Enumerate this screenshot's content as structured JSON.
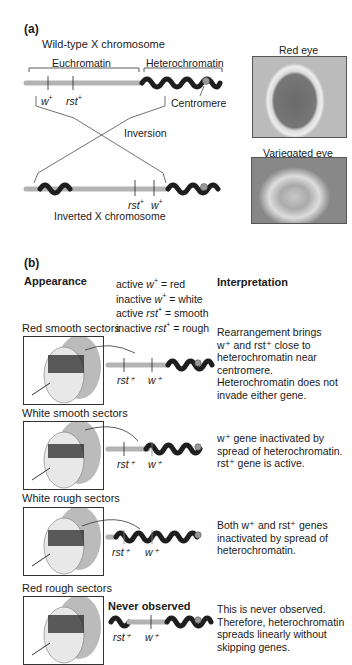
{
  "panel_a": {
    "label": "(a)",
    "wildtype_title": "Wild-type X chromosome",
    "euchromatin_label": "Euchromatin",
    "heterochromatin_label": "Heterochromatin",
    "gene_w": "w",
    "gene_rst": "rst",
    "plus": "+",
    "centromere_label": "Centromere",
    "inversion_label": "Inversion",
    "inverted_title": "Inverted X chromosome",
    "photos": {
      "red_eye_label": "Red eye",
      "variegated_eye_label": "Variegated eye"
    }
  },
  "panel_b": {
    "label": "(b)",
    "appearance_header": "Appearance",
    "interpretation_header": "Interpretation",
    "legend": [
      {
        "state": "active",
        "gene": "w",
        "result": "= red"
      },
      {
        "state": "inactive",
        "gene": "w",
        "result": "= white"
      },
      {
        "state": "active",
        "gene": "rst",
        "result": "= smooth"
      },
      {
        "state": "inactive",
        "gene": "rst",
        "result": "= rough"
      }
    ],
    "rows": [
      {
        "title": "Red smooth sectors",
        "interpretation": [
          "Rearrangement brings",
          "w⁺ and rst⁺ close to",
          "heterochromatin near",
          "centromere.",
          "Heterochromatin does not",
          "invade either gene."
        ]
      },
      {
        "title": "White smooth sectors",
        "interpretation": [
          "w⁺ gene inactivated by",
          "spread of heterochromatin.",
          "rst⁺ gene is active."
        ]
      },
      {
        "title": "White rough sectors",
        "interpretation": [
          "Both w⁺ and rst⁺ genes",
          "inactivated by spread of",
          "heterochromatin."
        ]
      },
      {
        "title": "Red rough sectors",
        "note": "Never observed",
        "interpretation": [
          "This is never observed.",
          "Therefore, heterochromatin",
          "spreads linearly without",
          "skipping genes."
        ]
      }
    ],
    "gene_rst": "rst⁺",
    "gene_w": "w⁺"
  },
  "colors": {
    "euchromatin": "#b3b3b3",
    "heterochromatin": "#1e1e1e",
    "centromere": "#9a9a9a",
    "line": "#333333"
  }
}
